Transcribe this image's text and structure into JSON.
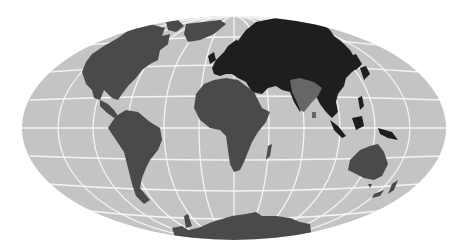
{
  "map": {
    "type": "world-map",
    "projection": "elliptical (Hammer/Aitoff-like), centered on prime meridian",
    "colors": {
      "ocean": "#c4c4c4",
      "graticule": "#f4f4f4",
      "eurasia": "#1e1e1e",
      "americas_africa_oceania_antarctica": "#4a4a4a",
      "indian_subcontinent": "#666666",
      "background": "#ffffff"
    },
    "regions": [
      {
        "name": "North America",
        "shade": "mid"
      },
      {
        "name": "Greenland",
        "shade": "mid"
      },
      {
        "name": "South America",
        "shade": "mid"
      },
      {
        "name": "Europe",
        "shade": "dark"
      },
      {
        "name": "Asia",
        "shade": "dark"
      },
      {
        "name": "Indian Subcontinent",
        "shade": "light"
      },
      {
        "name": "Africa",
        "shade": "mid"
      },
      {
        "name": "Madagascar",
        "shade": "mid"
      },
      {
        "name": "Southeast Asian Islands",
        "shade": "dark"
      },
      {
        "name": "Australia",
        "shade": "mid"
      },
      {
        "name": "New Zealand",
        "shade": "mid"
      },
      {
        "name": "Antarctica",
        "shade": "mid"
      }
    ]
  }
}
